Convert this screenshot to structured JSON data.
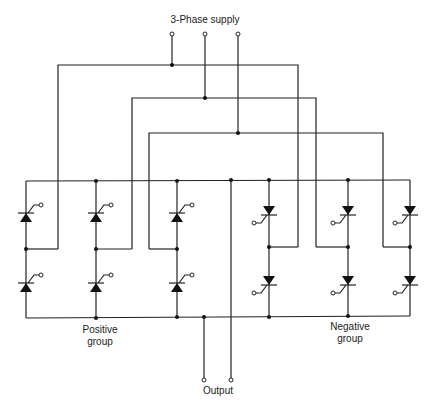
{
  "diagram": {
    "labels": {
      "supply": "3-Phase supply",
      "positive_group_line1": "Positive",
      "positive_group_line2": "group",
      "negative_group_line1": "Negative",
      "negative_group_line2": "group",
      "output": "Output"
    },
    "components": {
      "thyristors_positive_group": 6,
      "thyristors_negative_group": 6,
      "supply_terminals": 3,
      "output_terminals": 2
    },
    "colors": {
      "line": "#222222",
      "background": "#ffffff"
    }
  }
}
